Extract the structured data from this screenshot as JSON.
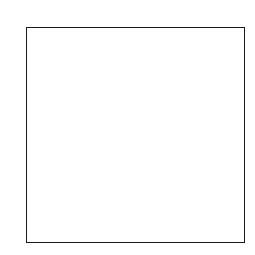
{
  "columns": [
    "A",
    "B",
    "C",
    "D",
    "E",
    "F",
    "G",
    "H",
    "I"
  ],
  "rows": [
    "A",
    "B",
    "C",
    "D",
    "E",
    "F",
    "G",
    "H",
    "I"
  ],
  "filled_cells": [
    [
      0,
      0
    ],
    [
      1,
      1
    ],
    [
      2,
      2
    ],
    [
      3,
      3
    ],
    [
      4,
      4
    ],
    [
      5,
      5
    ],
    [
      6,
      6
    ],
    [
      7,
      7
    ],
    [
      8,
      8
    ]
  ],
  "marks": [
    {
      "row": 4,
      "col": 2,
      "text": "X"
    },
    {
      "row": 5,
      "col": 1,
      "text": "Z"
    }
  ],
  "colors": {
    "filled": "#0d0d0d",
    "line": "#555555",
    "background": "#ffffff"
  }
}
